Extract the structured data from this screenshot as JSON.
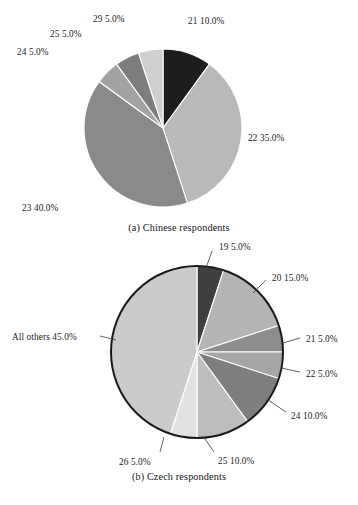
{
  "figure": {
    "background": "#ffffff",
    "text_color": "#1c1c1c"
  },
  "panels": [
    {
      "id": "a",
      "caption": "(a) Chinese respondents",
      "center": {
        "x": 163,
        "y": 128
      },
      "radius": 79,
      "outline": false,
      "start_angle": -90,
      "labels": [
        {
          "name": "label-21",
          "text": "21 10.0%",
          "x": 188,
          "y": 16
        },
        {
          "name": "label-22",
          "text": "22 35.0%",
          "x": 248,
          "y": 133
        },
        {
          "name": "label-23",
          "text": "23 40.0%",
          "x": 22,
          "y": 203
        },
        {
          "name": "label-24",
          "text": "24 5.0%",
          "x": 17,
          "y": 47
        },
        {
          "name": "label-25",
          "text": "25 5.0%",
          "x": 50,
          "y": 29
        },
        {
          "name": "label-29",
          "text": "29 5.0%",
          "x": 93,
          "y": 14
        }
      ]
    },
    {
      "id": "b",
      "caption": "(b) Czech respondents",
      "center": {
        "x": 197,
        "y": 352
      },
      "radius": 86,
      "outline": true,
      "outline_color": "#1a1a1a",
      "start_angle": -90,
      "labels": [
        {
          "name": "label-19",
          "text": "19 5.0%",
          "x": 219,
          "y": 242
        },
        {
          "name": "label-20",
          "text": "20 15.0%",
          "x": 272,
          "y": 273
        },
        {
          "name": "label-21",
          "text": "21 5.0%",
          "x": 306,
          "y": 334
        },
        {
          "name": "label-22",
          "text": "22 5.0%",
          "x": 306,
          "y": 369
        },
        {
          "name": "label-24",
          "text": "24 10.0%",
          "x": 291,
          "y": 411
        },
        {
          "name": "label-25",
          "text": "25 10.0%",
          "x": 218,
          "y": 456
        },
        {
          "name": "label-26",
          "text": "26 5.0%",
          "x": 119,
          "y": 457
        },
        {
          "name": "label-all-others",
          "text": "All others 45.0%",
          "x": 12,
          "y": 332
        }
      ],
      "leaders": [
        {
          "name": "leader-19",
          "x1": 212,
          "y1": 251,
          "x2": 206,
          "y2": 268
        },
        {
          "name": "leader-20",
          "x1": 266,
          "y1": 280,
          "x2": 253,
          "y2": 293
        },
        {
          "name": "leader-21",
          "x1": 300,
          "y1": 338,
          "x2": 283,
          "y2": 343
        },
        {
          "name": "leader-22",
          "x1": 300,
          "y1": 372,
          "x2": 281,
          "y2": 368
        },
        {
          "name": "leader-24",
          "x1": 286,
          "y1": 412,
          "x2": 268,
          "y2": 400
        },
        {
          "name": "leader-25",
          "x1": 214,
          "y1": 452,
          "x2": 205,
          "y2": 439
        },
        {
          "name": "leader-26",
          "x1": 160,
          "y1": 452,
          "x2": 164,
          "y2": 437
        },
        {
          "name": "leader-all-others",
          "x1": 100,
          "y1": 336,
          "x2": 116,
          "y2": 340
        }
      ]
    }
  ],
  "chart_data": [
    {
      "type": "pie",
      "title": "(a) Chinese respondents",
      "panel": "a",
      "unit": "percent",
      "start_angle": -90,
      "direction": "clockwise",
      "legend": "none",
      "labels_inline": true,
      "categories": [
        "21",
        "22",
        "23",
        "24",
        "25",
        "29"
      ],
      "values": [
        10.0,
        35.0,
        40.0,
        5.0,
        5.0,
        5.0
      ],
      "value_labels": [
        "21 10.0%",
        "22 35.0%",
        "23 40.0%",
        "24 5.0%",
        "25 5.0%",
        "29 5.0%"
      ],
      "colors": [
        "#1d1d1d",
        "#b9b9b9",
        "#8a8a8a",
        "#a3a3a3",
        "#7d7d7d",
        "#cfcfcf"
      ]
    },
    {
      "type": "pie",
      "title": "(b) Czech respondents",
      "panel": "b",
      "unit": "percent",
      "start_angle": -90,
      "direction": "clockwise",
      "legend": "none",
      "labels_inline": true,
      "categories": [
        "19",
        "20",
        "21",
        "22",
        "24",
        "25",
        "26",
        "All others"
      ],
      "values": [
        5.0,
        15.0,
        5.0,
        5.0,
        10.0,
        10.0,
        5.0,
        45.0
      ],
      "value_labels": [
        "19 5.0%",
        "20 15.0%",
        "21 5.0%",
        "22 5.0%",
        "24 10.0%",
        "25 10.0%",
        "26 5.0%",
        "All others 45.0%"
      ],
      "colors": [
        "#3f3f3f",
        "#b4b4b4",
        "#8d8d8d",
        "#a6a6a6",
        "#7e7e7e",
        "#bdbdbd",
        "#e2e2e2",
        "#cbcbcb"
      ]
    }
  ]
}
